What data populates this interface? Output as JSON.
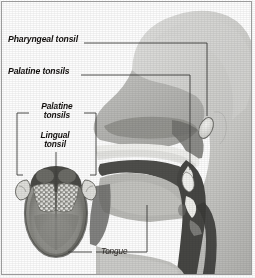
{
  "figure": {
    "border_color": "#9a9a9a",
    "background_color": "#fdfdfd"
  },
  "labels": {
    "pharyngeal_tonsil": "Pharyngeal tonsil",
    "palatine_tonsils": "Palatine tonsils",
    "inset_palatine_line1": "Palatine",
    "inset_palatine_line2": "tonsils",
    "inset_lingual_line1": "Lingual",
    "inset_lingual_line2": "tonsil",
    "tongue": "Tongue"
  },
  "diagram_data": {
    "type": "anatomical-illustration",
    "style": "grayscale halftone medical illustration",
    "views": [
      {
        "name": "sagittal-head-section",
        "description": "Mid-sagittal section of human head and neck showing nasal cavity, oral cavity, palate, tongue, pharynx and larynx",
        "structures": [
          "pharyngeal tonsil",
          "palatine tonsil",
          "soft palate",
          "tongue",
          "epiglottis",
          "nasal cavity",
          "pharyngeal airway",
          "esophagus"
        ]
      },
      {
        "name": "tongue-superior-view-inset",
        "description": "Superior view of the tongue showing cobblestone lingual tonsil tissue at the root and paired palatine tonsils laterally",
        "structures": [
          "lingual tonsil",
          "palatine tonsils",
          "tongue body",
          "median sulcus"
        ]
      }
    ],
    "callouts": [
      {
        "label": "Pharyngeal tonsil",
        "target": "pharyngeal tonsil in nasopharynx",
        "view": "sagittal-head-section",
        "style": "bold italic"
      },
      {
        "label": "Palatine tonsils",
        "target": "palatine tonsil in oropharynx",
        "view": "sagittal-head-section",
        "style": "bold italic"
      },
      {
        "label": "Palatine tonsils",
        "target": "paired palatine tonsils",
        "view": "tongue-superior-view-inset",
        "style": "bold italic bracket"
      },
      {
        "label": "Lingual tonsil",
        "target": "lingual tonsil tissue",
        "view": "tongue-superior-view-inset",
        "style": "bold italic"
      },
      {
        "label": "Tongue",
        "target": "tongue body",
        "view": "sagittal-head-section",
        "style": "italic"
      }
    ],
    "palette": {
      "paper": "#fdfdfd",
      "skin_light": "#d9d9d7",
      "skin_mid": "#bdbdba",
      "skin_dark": "#a3a3a0",
      "tissue_dark": "#6f6f6d",
      "airway_dark": "#4b4b49",
      "airway_darkest": "#3a3a38",
      "tonsil_highlight": "#efefec",
      "leader_line": "#3c3c3a",
      "text": "#14110f"
    }
  }
}
